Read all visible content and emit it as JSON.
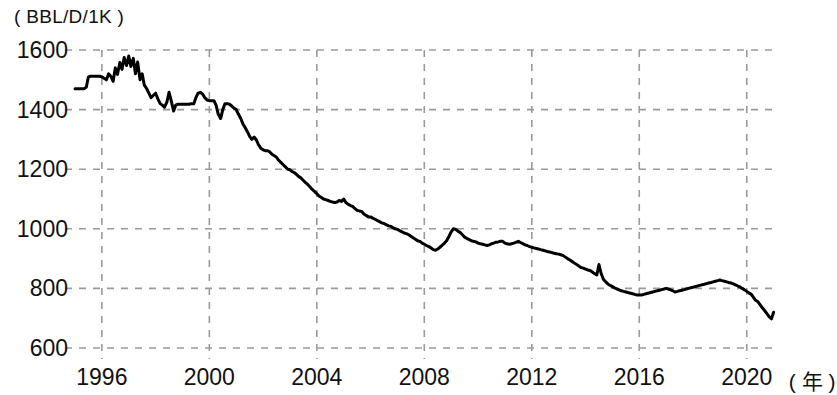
{
  "chart_data": {
    "type": "line",
    "title": "",
    "subtitle": "",
    "xlabel": "( 年 )",
    "ylabel": "( BBL/D/1K )",
    "unit_label": "( BBL/D/1K )",
    "x_axis_unit": "( 年 )",
    "grid": true,
    "grid_style": "dashed",
    "legend": "none",
    "xlim": [
      1995.0,
      2021.2
    ],
    "ylim": [
      600,
      1600
    ],
    "xticks": [
      1996,
      2000,
      2004,
      2008,
      2012,
      2016,
      2020
    ],
    "xtick_labels": [
      "1996",
      "2000",
      "2004",
      "2008",
      "2012",
      "2016",
      "2020"
    ],
    "yticks": [
      600,
      800,
      1000,
      1200,
      1400,
      1600
    ],
    "ytick_labels": [
      "600",
      "800",
      "1000",
      "1200",
      "1400",
      "1600"
    ],
    "line_color": "#000000",
    "line_width": 3,
    "series": [
      {
        "name": "production",
        "x": [
          1995.0,
          1995.08,
          1995.17,
          1995.25,
          1995.33,
          1995.42,
          1995.5,
          1995.58,
          1995.67,
          1995.75,
          1995.83,
          1995.92,
          1996.0,
          1996.08,
          1996.17,
          1996.25,
          1996.33,
          1996.42,
          1996.5,
          1996.58,
          1996.67,
          1996.75,
          1996.83,
          1996.92,
          1997.0,
          1997.08,
          1997.17,
          1997.25,
          1997.33,
          1997.42,
          1997.5,
          1997.58,
          1997.67,
          1997.75,
          1997.83,
          1997.92,
          1998.0,
          1998.08,
          1998.17,
          1998.25,
          1998.33,
          1998.42,
          1998.5,
          1998.58,
          1998.67,
          1998.75,
          1998.83,
          1998.92,
          1999.0,
          1999.08,
          1999.17,
          1999.25,
          1999.33,
          1999.42,
          1999.5,
          1999.58,
          1999.67,
          1999.75,
          1999.83,
          1999.92,
          2000.0,
          2000.08,
          2000.17,
          2000.25,
          2000.33,
          2000.42,
          2000.5,
          2000.58,
          2000.67,
          2000.75,
          2000.83,
          2000.92,
          2001.0,
          2001.08,
          2001.17,
          2001.25,
          2001.33,
          2001.42,
          2001.5,
          2001.58,
          2001.67,
          2001.75,
          2001.83,
          2001.92,
          2002.0,
          2002.08,
          2002.17,
          2002.25,
          2002.33,
          2002.42,
          2002.5,
          2002.58,
          2002.67,
          2002.75,
          2002.83,
          2002.92,
          2003.0,
          2003.08,
          2003.17,
          2003.25,
          2003.33,
          2003.42,
          2003.5,
          2003.58,
          2003.67,
          2003.75,
          2003.83,
          2003.92,
          2004.0,
          2004.08,
          2004.17,
          2004.25,
          2004.33,
          2004.42,
          2004.5,
          2004.58,
          2004.67,
          2004.75,
          2004.83,
          2004.92,
          2005.0,
          2005.08,
          2005.17,
          2005.25,
          2005.33,
          2005.42,
          2005.5,
          2005.58,
          2005.67,
          2005.75,
          2005.83,
          2005.92,
          2006.0,
          2006.08,
          2006.17,
          2006.25,
          2006.33,
          2006.42,
          2006.5,
          2006.58,
          2006.67,
          2006.75,
          2006.83,
          2006.92,
          2007.0,
          2007.08,
          2007.17,
          2007.25,
          2007.33,
          2007.42,
          2007.5,
          2007.58,
          2007.67,
          2007.75,
          2007.83,
          2007.92,
          2008.0,
          2008.08,
          2008.17,
          2008.25,
          2008.33,
          2008.42,
          2008.5,
          2008.58,
          2008.67,
          2008.75,
          2008.83,
          2008.92,
          2009.0,
          2009.08,
          2009.17,
          2009.25,
          2009.33,
          2009.42,
          2009.5,
          2009.58,
          2009.67,
          2009.75,
          2009.83,
          2009.92,
          2010.0,
          2010.08,
          2010.17,
          2010.25,
          2010.33,
          2010.42,
          2010.5,
          2010.58,
          2010.67,
          2010.75,
          2010.83,
          2010.92,
          2011.0,
          2011.08,
          2011.17,
          2011.25,
          2011.33,
          2011.42,
          2011.5,
          2011.58,
          2011.67,
          2011.75,
          2011.83,
          2011.92,
          2012.0,
          2012.08,
          2012.17,
          2012.25,
          2012.33,
          2012.42,
          2012.5,
          2012.58,
          2012.67,
          2012.75,
          2012.83,
          2012.92,
          2013.0,
          2013.08,
          2013.17,
          2013.25,
          2013.33,
          2013.42,
          2013.5,
          2013.58,
          2013.67,
          2013.75,
          2013.83,
          2013.92,
          2014.0,
          2014.08,
          2014.17,
          2014.25,
          2014.33,
          2014.42,
          2014.5,
          2014.58,
          2014.67,
          2014.75,
          2014.83,
          2014.92,
          2015.0,
          2015.08,
          2015.17,
          2015.25,
          2015.33,
          2015.42,
          2015.5,
          2015.58,
          2015.67,
          2015.75,
          2015.83,
          2015.92,
          2016.0,
          2016.08,
          2016.17,
          2016.25,
          2016.33,
          2016.42,
          2016.5,
          2016.58,
          2016.67,
          2016.75,
          2016.83,
          2016.92,
          2017.0,
          2017.08,
          2017.17,
          2017.25,
          2017.33,
          2017.42,
          2017.5,
          2017.58,
          2017.67,
          2017.75,
          2017.83,
          2017.92,
          2018.0,
          2018.08,
          2018.17,
          2018.25,
          2018.33,
          2018.42,
          2018.5,
          2018.58,
          2018.67,
          2018.75,
          2018.83,
          2018.92,
          2019.0,
          2019.08,
          2019.17,
          2019.25,
          2019.33,
          2019.42,
          2019.5,
          2019.58,
          2019.67,
          2019.75,
          2019.83,
          2019.92,
          2020.0,
          2020.08,
          2020.17,
          2020.25,
          2020.33,
          2020.42,
          2020.5,
          2020.58,
          2020.67,
          2020.75,
          2020.83,
          2020.92,
          2021.0
        ],
        "y": [
          1470,
          1470,
          1470,
          1470,
          1470,
          1475,
          1510,
          1512,
          1512,
          1512,
          1512,
          1512,
          1510,
          1505,
          1500,
          1520,
          1512,
          1495,
          1540,
          1518,
          1558,
          1535,
          1575,
          1548,
          1580,
          1545,
          1572,
          1520,
          1560,
          1500,
          1520,
          1482,
          1470,
          1455,
          1440,
          1448,
          1455,
          1437,
          1420,
          1415,
          1408,
          1425,
          1458,
          1430,
          1395,
          1415,
          1418,
          1418,
          1418,
          1418,
          1418,
          1418,
          1420,
          1420,
          1440,
          1455,
          1458,
          1452,
          1440,
          1432,
          1430,
          1430,
          1430,
          1415,
          1385,
          1370,
          1400,
          1420,
          1420,
          1418,
          1412,
          1405,
          1400,
          1385,
          1370,
          1352,
          1340,
          1325,
          1310,
          1300,
          1308,
          1298,
          1282,
          1270,
          1265,
          1262,
          1262,
          1258,
          1250,
          1245,
          1240,
          1230,
          1222,
          1215,
          1208,
          1200,
          1198,
          1192,
          1188,
          1182,
          1175,
          1170,
          1162,
          1155,
          1148,
          1140,
          1132,
          1125,
          1118,
          1110,
          1105,
          1100,
          1098,
          1095,
          1092,
          1090,
          1088,
          1090,
          1095,
          1092,
          1100,
          1088,
          1082,
          1078,
          1075,
          1068,
          1062,
          1060,
          1058,
          1050,
          1045,
          1040,
          1040,
          1036,
          1032,
          1028,
          1024,
          1020,
          1018,
          1014,
          1010,
          1008,
          1004,
          1000,
          998,
          994,
          990,
          986,
          984,
          980,
          975,
          970,
          965,
          960,
          958,
          952,
          948,
          944,
          940,
          936,
          930,
          928,
          932,
          938,
          945,
          952,
          960,
          975,
          990,
          1000,
          998,
          992,
          988,
          980,
          972,
          968,
          964,
          960,
          958,
          956,
          952,
          950,
          948,
          946,
          944,
          946,
          950,
          952,
          955,
          956,
          958,
          958,
          952,
          950,
          948,
          950,
          952,
          955,
          958,
          954,
          950,
          946,
          944,
          940,
          938,
          936,
          934,
          932,
          930,
          928,
          926,
          924,
          922,
          920,
          918,
          916,
          915,
          913,
          910,
          905,
          900,
          895,
          890,
          885,
          880,
          875,
          870,
          868,
          865,
          862,
          860,
          855,
          850,
          845,
          880,
          850,
          830,
          822,
          815,
          810,
          806,
          802,
          798,
          795,
          792,
          790,
          788,
          786,
          784,
          782,
          780,
          778,
          778,
          778,
          780,
          782,
          784,
          786,
          788,
          790,
          792,
          794,
          796,
          798,
          800,
          798,
          795,
          792,
          788,
          790,
          792,
          794,
          796,
          798,
          800,
          802,
          804,
          806,
          808,
          810,
          812,
          814,
          816,
          818,
          820,
          822,
          824,
          826,
          828,
          826,
          824,
          822,
          820,
          818,
          815,
          812,
          808,
          805,
          800,
          795,
          790,
          785,
          780,
          770,
          760,
          755,
          745,
          735,
          725,
          715,
          705,
          698,
          720
        ]
      }
    ],
    "annotations": []
  },
  "axes": {
    "y_ticks": [
      {
        "value": 1600,
        "label": "1600"
      },
      {
        "value": 1400,
        "label": "1400"
      },
      {
        "value": 1200,
        "label": "1200"
      },
      {
        "value": 1000,
        "label": "1000"
      },
      {
        "value": 800,
        "label": "800"
      },
      {
        "value": 600,
        "label": "600"
      }
    ],
    "x_ticks": [
      {
        "value": 1996,
        "label": "1996"
      },
      {
        "value": 2000,
        "label": "2000"
      },
      {
        "value": 2004,
        "label": "2004"
      },
      {
        "value": 2008,
        "label": "2008"
      },
      {
        "value": 2012,
        "label": "2012"
      },
      {
        "value": 2016,
        "label": "2016"
      },
      {
        "value": 2020,
        "label": "2020"
      }
    ],
    "y_unit_label": "( BBL/D/1K )",
    "x_unit_label": "( 年 )"
  }
}
